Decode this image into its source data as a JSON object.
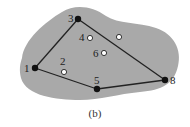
{
  "figure": {
    "caption": "(b)",
    "region_color": "#a9a9a9",
    "edge_color": "#222222",
    "filled_nodes": [
      {
        "id": "1",
        "label": "1",
        "x": 35,
        "y": 68,
        "lx": 24,
        "ly": 72
      },
      {
        "id": "3",
        "label": "3",
        "x": 78,
        "y": 19,
        "lx": 68,
        "ly": 22
      },
      {
        "id": "5",
        "label": "5",
        "x": 97,
        "y": 89,
        "lx": 94,
        "ly": 84
      },
      {
        "id": "8",
        "label": "8",
        "x": 165,
        "y": 80,
        "lx": 170,
        "ly": 84
      }
    ],
    "hollow_nodes": [
      {
        "id": "2",
        "label": "2",
        "x": 64,
        "y": 72,
        "lx": 60,
        "ly": 65
      },
      {
        "id": "4",
        "label": "4",
        "x": 90,
        "y": 38,
        "lx": 79,
        "ly": 41
      },
      {
        "id": "6",
        "label": "6",
        "x": 104,
        "y": 53,
        "lx": 93,
        "ly": 57
      },
      {
        "id": "7",
        "label": "",
        "x": 119,
        "y": 37,
        "lx": 0,
        "ly": 0
      }
    ],
    "edges": [
      [
        "1",
        "3"
      ],
      [
        "3",
        "8"
      ],
      [
        "8",
        "5"
      ],
      [
        "5",
        "1"
      ]
    ]
  }
}
